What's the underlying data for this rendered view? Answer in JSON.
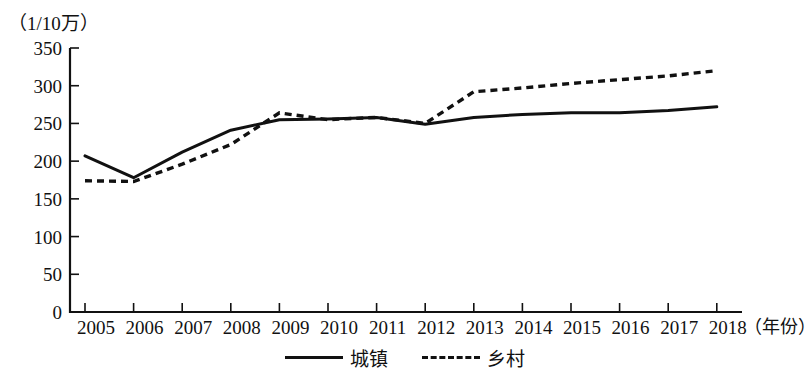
{
  "chart_data": {
    "type": "line",
    "title": "",
    "subtitle": "",
    "xlabel": "（年份）",
    "ylabel": "（1/10万）",
    "x": [
      2005,
      2006,
      2007,
      2008,
      2009,
      2010,
      2011,
      2012,
      2013,
      2014,
      2015,
      2016,
      2017,
      2018
    ],
    "categories": [
      "2005",
      "2006",
      "2007",
      "2008",
      "2009",
      "2010",
      "2011",
      "2012",
      "2013",
      "2014",
      "2015",
      "2016",
      "2017",
      "2018"
    ],
    "series": [
      {
        "name": "城镇",
        "style": "solid",
        "values": [
          207,
          178,
          212,
          241,
          255,
          256,
          258,
          249,
          258,
          262,
          264,
          264,
          267,
          272
        ]
      },
      {
        "name": "乡村",
        "style": "dashed",
        "values": [
          174,
          173,
          196,
          222,
          264,
          255,
          258,
          250,
          292,
          297,
          303,
          308,
          313,
          320
        ]
      }
    ],
    "ylim": [
      0,
      350
    ],
    "yticks": [
      0,
      50,
      100,
      150,
      200,
      250,
      300,
      350
    ],
    "ytick_labels": [
      "0",
      "50",
      "100",
      "150",
      "200",
      "250",
      "300",
      "350"
    ],
    "xlim": [
      2005,
      2018
    ],
    "grid": false,
    "legend_position": "bottom-center",
    "line_color": "#111111",
    "background_color": "#ffffff"
  },
  "axes": {
    "y_title": "（1/10万）",
    "x_title": "（年份）",
    "y_ticks": [
      "350",
      "300",
      "250",
      "200",
      "150",
      "100",
      "50",
      "0"
    ],
    "x_ticks": [
      "2005",
      "2006",
      "2007",
      "2008",
      "2009",
      "2010",
      "2011",
      "2012",
      "2013",
      "2014",
      "2015",
      "2016",
      "2017",
      "2018"
    ]
  },
  "legend": {
    "items": [
      {
        "label": "城镇",
        "style": "solid"
      },
      {
        "label": "乡村",
        "style": "dashed"
      }
    ]
  }
}
